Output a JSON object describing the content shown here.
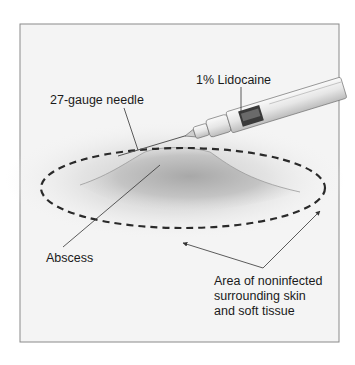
{
  "figure": {
    "labels": {
      "lidocaine": "1% Lidocaine",
      "needle": "27-gauge needle",
      "abscess": "Abscess",
      "area_line1": "Area of noninfected",
      "area_line2": "surrounding skin",
      "area_line3": "and soft tissue"
    },
    "colors": {
      "frame_border": "#8a8a8a",
      "background": "#f4f4f4",
      "dashed_ellipse": "#2a2a2a",
      "leader_lines": "#333333"
    }
  }
}
